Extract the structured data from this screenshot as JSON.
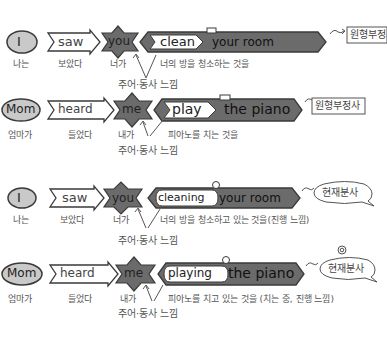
{
  "colors": {
    "dark_fill": "#6b6b6b",
    "mid_fill": "#8a8a8a",
    "light_fill": "#c9c9c9",
    "outline": "#3a3a3a",
    "white": "#ffffff",
    "korean_text": "#555555"
  },
  "examples": [
    {
      "subject": "I",
      "verb": "saw",
      "object": "you",
      "complement": "clean",
      "rest": "your room",
      "tag": "원형부정사",
      "tag_shape": "box",
      "ko_subject": "나는",
      "ko_verb": "보았다",
      "ko_object": "너가",
      "ko_complement": "너의 방을 청소하는 것을",
      "relation_note": "주어·동사 느낌"
    },
    {
      "subject": "Mom",
      "verb": "heard",
      "object": "me",
      "complement": "play",
      "rest": "the piano",
      "tag": "원형부정사",
      "tag_shape": "box",
      "ko_subject": "엄마가",
      "ko_verb": "들었다",
      "ko_object": "내가",
      "ko_complement": "피아노를 치는 것을",
      "relation_note": "주어·동사 느낌"
    },
    {
      "subject": "I",
      "verb": "saw",
      "object": "you",
      "complement": "cleaning",
      "rest": "your room",
      "tag": "현재분사",
      "tag_shape": "bubble",
      "ko_subject": "나는",
      "ko_verb": "보았다",
      "ko_object": "너가",
      "ko_complement": "너의 방을 청소하고 있는 것을(진행 느낌)",
      "relation_note": "주어·동사 느낌"
    },
    {
      "subject": "Mom",
      "verb": "heard",
      "object": "me",
      "complement": "playing",
      "rest": "the piano",
      "tag": "현재분사",
      "tag_shape": "bubble",
      "ko_subject": "엄마가",
      "ko_verb": "들었다",
      "ko_object": "내가",
      "ko_complement": "피아노를 치고 있는 것을 (치는 중, 진행 느낌)",
      "relation_note": "주어·동사 느낌"
    }
  ]
}
